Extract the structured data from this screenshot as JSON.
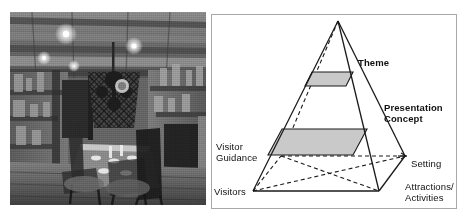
{
  "figure": {
    "left_image": {
      "name": "historic-interior-photograph",
      "alt": "Black and white photograph of a historic tavern interior with long dining table, wooden chairs, chandelier and exposed ceiling beams",
      "style": "grayscale-halftone"
    },
    "diagram": {
      "type": "pyramid-3d",
      "shape": "three-dimensional pyramid with square base drawn in perspective, hidden edges dashed",
      "bands": [
        {
          "id": "theme-band",
          "label": "Theme",
          "bold": true,
          "fill": "#c9c9c9"
        },
        {
          "id": "presentation-band",
          "label": "Presentation Concept",
          "bold": true,
          "fill": "#c9c9c9"
        }
      ],
      "labels": {
        "theme": "Theme",
        "presentation_concept": "Presentation\nConcept",
        "visitor_guidance": "Visitor\nGuidance",
        "visitors": "Visitors",
        "setting": "Setting",
        "attractions_activities": "Attractions/\nActivities"
      },
      "colors": {
        "stroke": "#1a1a1a",
        "band_fill": "#c9c9c9",
        "panel_border": "#a8a8a8",
        "background": "#ffffff"
      }
    }
  }
}
